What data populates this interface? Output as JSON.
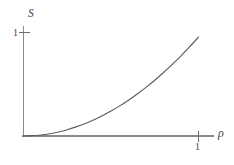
{
  "chart_data": {
    "type": "line",
    "title": "",
    "subtitle": "",
    "xlabel": "ρ",
    "ylabel": "S",
    "xlim": [
      0,
      1.09
    ],
    "ylim": [
      0,
      1.09
    ],
    "xticks": [
      1
    ],
    "xticklabels": [
      "1"
    ],
    "yticks": [
      1
    ],
    "yticklabels": [
      "1"
    ],
    "grid": false,
    "legend": null,
    "annotations": [],
    "series": [
      {
        "name": "S(ρ)",
        "color": "#5c5c5c",
        "x": [
          0.0,
          0.05,
          0.1,
          0.15,
          0.2,
          0.25,
          0.3,
          0.35,
          0.4,
          0.45,
          0.5,
          0.55,
          0.6,
          0.65,
          0.7,
          0.75,
          0.8,
          0.85,
          0.9,
          0.95,
          1.0
        ],
        "y": [
          0.0,
          0.003,
          0.01,
          0.022,
          0.039,
          0.061,
          0.088,
          0.119,
          0.155,
          0.196,
          0.241,
          0.291,
          0.346,
          0.406,
          0.47,
          0.539,
          0.613,
          0.692,
          0.775,
          0.863,
          0.956
        ]
      }
    ]
  },
  "axes": {
    "ylabel": "S",
    "xlabel": "ρ",
    "ytick_one": "1",
    "xtick_one": "1"
  },
  "colors": {
    "curve": "#5c5c5c",
    "axis": "#8a8a8a",
    "tick": "#6e6e6e",
    "background": "#ffffff",
    "label_text": "#3d3d3d"
  }
}
